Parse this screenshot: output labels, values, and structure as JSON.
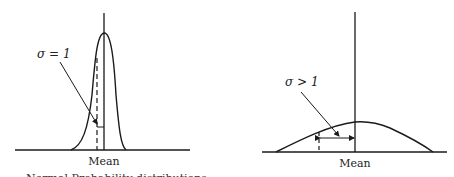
{
  "figure": {
    "left_panel": {
      "sigma_label": "σ = 1",
      "mean_label": "Mean",
      "description": "narrow, tall distribution"
    },
    "right_panel": {
      "sigma_label": "σ > 1",
      "mean_label": "Mean",
      "description": "wide, flat distribution"
    },
    "caption_partial": "Normal Probability distributions"
  },
  "colors": {
    "ink": "#1a1a1a",
    "background": "#ffffff"
  }
}
